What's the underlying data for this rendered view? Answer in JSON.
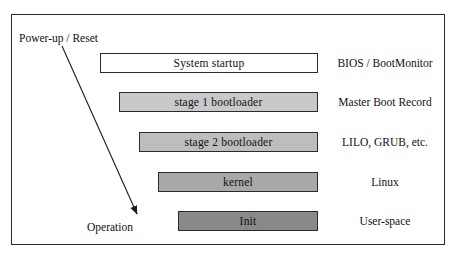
{
  "figure": {
    "border_color": "#2b2b2b",
    "background": "#ffffff"
  },
  "flow_arrow": {
    "start_label": "Power-up / Reset",
    "end_label": "Operation",
    "color": "#1a1a1a"
  },
  "stages": [
    {
      "label": "System startup",
      "note": "BIOS / BootMonitor",
      "fill": "#ffffff",
      "left": 100,
      "top": 53,
      "width": 218,
      "height": 20
    },
    {
      "label": "stage 1 bootloader",
      "note": "Master Boot Record",
      "fill": "#c9c9c9",
      "left": 119,
      "top": 92,
      "width": 199,
      "height": 20
    },
    {
      "label": "stage 2 bootloader",
      "note": "LILO, GRUB, etc.",
      "fill": "#bdbdbd",
      "left": 139,
      "top": 132,
      "width": 179,
      "height": 20
    },
    {
      "label": "kernel",
      "note": "Linux",
      "fill": "#a9a9a9",
      "left": 158,
      "top": 172,
      "width": 160,
      "height": 20
    },
    {
      "label": "Init",
      "note": "User-space",
      "fill": "#898989",
      "left": 178,
      "top": 211,
      "width": 140,
      "height": 20
    }
  ],
  "note_column_center_x": 385
}
